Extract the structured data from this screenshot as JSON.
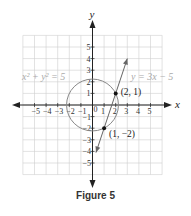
{
  "chart_data": {
    "type": "line",
    "title": "Figure 5",
    "xlabel": "x",
    "ylabel": "y",
    "xlim": [
      -6,
      6
    ],
    "ylim": [
      -6,
      6
    ],
    "grid": true,
    "x_ticks": [
      -5,
      -4,
      -3,
      -2,
      -1,
      1,
      2,
      3,
      4,
      5
    ],
    "y_ticks": [
      -5,
      -4,
      -3,
      -2,
      -1,
      1,
      2,
      3,
      4,
      5
    ],
    "origin_label": "0",
    "series": [
      {
        "name": "x² + y² = 5",
        "kind": "circle",
        "center": [
          0,
          0
        ],
        "radius": 2.236,
        "color": "#888888"
      },
      {
        "name": "y = 3x − 5",
        "kind": "line",
        "slope": 3,
        "intercept": -5,
        "x_range": [
          0.3,
          3
        ],
        "color": "#666666"
      }
    ],
    "points": [
      {
        "label": "(2, 1)",
        "x": 2,
        "y": 1
      },
      {
        "label": "(1, −2)",
        "x": 1,
        "y": -2
      }
    ],
    "annotations": [
      {
        "text": "x² + y² = 5",
        "position": "upper-left"
      },
      {
        "text": "y = 3x − 5",
        "position": "upper-right"
      }
    ]
  },
  "labels": {
    "circle_eq": "x² + y² = 5",
    "line_eq": "y = 3x − 5",
    "point_a": "(2, 1)",
    "point_b": "(1, −2)",
    "x_axis": "x",
    "y_axis": "y",
    "caption": "Figure 5"
  }
}
